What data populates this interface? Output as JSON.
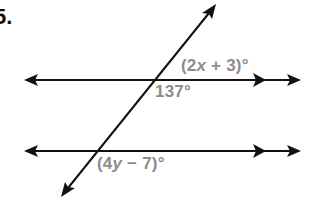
{
  "problem": {
    "number": "5."
  },
  "labels": {
    "top_right": {
      "open": "(2",
      "var": "x",
      "close": " + 3)°"
    },
    "top_below": "137°",
    "bottom_below": {
      "open": "(4",
      "var": "y",
      "close": " − 7)°"
    }
  },
  "colors": {
    "line": "#111111",
    "label": "#8c8c8c",
    "background": "#ffffff"
  },
  "geometry": {
    "top_line": {
      "y": 80,
      "x1": 24,
      "x2": 300,
      "parallel_mark_x": 263
    },
    "bottom_line": {
      "y": 151,
      "x1": 24,
      "x2": 300,
      "parallel_mark_x": 263
    },
    "transversal": {
      "x1": 62,
      "y1": 196,
      "x2": 215,
      "y2": 5
    }
  }
}
